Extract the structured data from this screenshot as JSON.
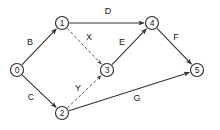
{
  "diagram": {
    "type": "directed-graph",
    "title": "",
    "background_color": "#ffffff",
    "node_stroke_color": "#2b2b2b",
    "edge_solid_color": "#333333",
    "edge_dashed_color": "#555555",
    "label_color": "#1a1a1a",
    "nodes": [
      {
        "id": "0",
        "label": "0",
        "x": 17,
        "y": 70,
        "r": 6.5
      },
      {
        "id": "1",
        "label": "1",
        "x": 62,
        "y": 23,
        "r": 6.5
      },
      {
        "id": "2",
        "label": "2",
        "x": 62,
        "y": 113,
        "r": 6.5
      },
      {
        "id": "3",
        "label": "3",
        "x": 107,
        "y": 70,
        "r": 6.5
      },
      {
        "id": "4",
        "label": "4",
        "x": 152,
        "y": 23,
        "r": 6.5
      },
      {
        "id": "5",
        "label": "5",
        "x": 197,
        "y": 70,
        "r": 6.5
      }
    ],
    "edges": [
      {
        "id": "B",
        "label": "B",
        "from": "0",
        "to": "1",
        "style": "solid",
        "label_x": 30,
        "label_y": 42
      },
      {
        "id": "C",
        "label": "C",
        "from": "0",
        "to": "2",
        "style": "solid",
        "label_x": 31,
        "label_y": 97
      },
      {
        "id": "D",
        "label": "D",
        "from": "1",
        "to": "4",
        "style": "solid",
        "label_x": 108,
        "label_y": 11
      },
      {
        "id": "X",
        "label": "X",
        "from": "1",
        "to": "3",
        "style": "dashed",
        "label_x": 89,
        "label_y": 37
      },
      {
        "id": "Y",
        "label": "Y",
        "from": "2",
        "to": "3",
        "style": "dashed",
        "label_x": 78,
        "label_y": 88
      },
      {
        "id": "E",
        "label": "E",
        "from": "3",
        "to": "4",
        "style": "solid",
        "label_x": 122,
        "label_y": 42
      },
      {
        "id": "F",
        "label": "F",
        "from": "4",
        "to": "5",
        "style": "solid",
        "label_x": 176,
        "label_y": 37
      },
      {
        "id": "G",
        "label": "G",
        "from": "2",
        "to": "5",
        "style": "solid",
        "label_x": 137,
        "label_y": 98
      }
    ]
  }
}
